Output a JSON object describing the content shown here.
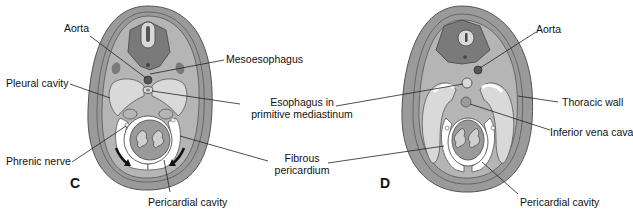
{
  "colors": {
    "background": "#ffffff",
    "outer_wall": "#9a9a9a",
    "body_dark": "#7a7a7a",
    "body_mid": "#aaaaaa",
    "cavity_light": "#d9d9d9",
    "white_space": "#ffffff",
    "outline": "#444444",
    "leader_line": "#222222",
    "text": "#111111"
  },
  "panels": [
    {
      "letter": "C",
      "labels": {
        "aorta": "Aorta",
        "mesoesophagus": "Mesoesophagus",
        "pleural_cavity": "Pleural cavity",
        "phrenic_nerve": "Phrenic nerve",
        "pericardial_cavity": "Pericardial cavity"
      }
    },
    {
      "letter": "D",
      "labels": {
        "aorta": "Aorta",
        "thoracic_wall": "Thoracic wall",
        "inferior_vena_cava": "Inferior vena cava",
        "pericardial_cavity": "Pericardial cavity"
      }
    }
  ],
  "shared_labels": {
    "esophagus_line1": "Esophagus in",
    "esophagus_line2": "primitive mediastinum",
    "fibrous_line1": "Fibrous",
    "fibrous_line2": "pericardium"
  }
}
